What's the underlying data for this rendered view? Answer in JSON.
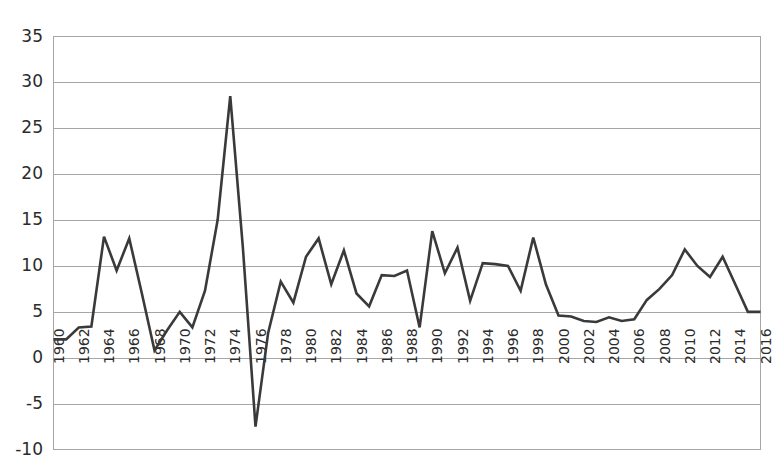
{
  "chart_data": {
    "type": "line",
    "title": "",
    "subtitle": "",
    "xlabel": "",
    "ylabel": "",
    "grid": true,
    "legend": false,
    "legend_position": "none",
    "line_color": "#3a3a3a",
    "grid_color": "#a6a6a6",
    "axis_text_color": "#2b2b2b",
    "background_color": "#ffffff",
    "xlim": [
      1960,
      2016
    ],
    "ylim": [
      -10,
      35
    ],
    "ytick_step": 5,
    "xtick_step": 2,
    "xtick_rotation": -90,
    "ytick_labels": [
      "35",
      "30",
      "25",
      "20",
      "15",
      "10",
      "5",
      "0",
      "-5",
      "-10"
    ],
    "ytick_values": [
      35,
      30,
      25,
      20,
      15,
      10,
      5,
      0,
      -5,
      -10
    ],
    "xtick_labels": [
      "1960",
      "1962",
      "1964",
      "1966",
      "1968",
      "1970",
      "1972",
      "1974",
      "1976",
      "1978",
      "1980",
      "1982",
      "1984",
      "1986",
      "1988",
      "1990",
      "1992",
      "1994",
      "1996",
      "1998",
      "2000",
      "2002",
      "2004",
      "2006",
      "2008",
      "2010",
      "2012",
      "2014",
      "2016"
    ],
    "x": [
      1960,
      1961,
      1962,
      1963,
      1964,
      1965,
      1966,
      1967,
      1968,
      1969,
      1970,
      1971,
      1972,
      1973,
      1974,
      1975,
      1976,
      1977,
      1978,
      1979,
      1980,
      1981,
      1982,
      1983,
      1984,
      1985,
      1986,
      1987,
      1988,
      1989,
      1990,
      1991,
      1992,
      1993,
      1994,
      1995,
      1996,
      1997,
      1998,
      1999,
      2000,
      2001,
      2002,
      2003,
      2004,
      2005,
      2006,
      2007,
      2008,
      2009,
      2010,
      2011,
      2012,
      2013,
      2014,
      2015,
      2016
    ],
    "values": [
      2.0,
      2.0,
      3.3,
      3.4,
      13.2,
      9.5,
      13.0,
      7.0,
      0.8,
      3.0,
      5.0,
      3.3,
      7.3,
      15.0,
      28.5,
      12.0,
      -7.5,
      2.7,
      8.3,
      6.0,
      11.0,
      13.0,
      8.0,
      11.7,
      7.0,
      5.6,
      9.0,
      8.9,
      9.5,
      3.3,
      13.8,
      9.2,
      12.0,
      6.2,
      10.3,
      10.2,
      10.0,
      7.3,
      13.1,
      8.0,
      4.6,
      4.5,
      4.0,
      3.9,
      4.4,
      4.0,
      4.2,
      6.3,
      7.5,
      9.0,
      11.8,
      10.0,
      8.8,
      11.0,
      8.0,
      5.0,
      5.0
    ],
    "series": [
      {
        "name": "series-1",
        "values": [
          2.0,
          2.0,
          3.3,
          3.4,
          13.2,
          9.5,
          13.0,
          7.0,
          0.8,
          3.0,
          5.0,
          3.3,
          7.3,
          15.0,
          28.5,
          12.0,
          -7.5,
          2.7,
          8.3,
          6.0,
          11.0,
          13.0,
          8.0,
          11.7,
          7.0,
          5.6,
          9.0,
          8.9,
          9.5,
          3.3,
          13.8,
          9.2,
          12.0,
          6.2,
          10.3,
          10.2,
          10.0,
          7.3,
          13.1,
          8.0,
          4.6,
          4.5,
          4.0,
          3.9,
          4.4,
          4.0,
          4.2,
          6.3,
          7.5,
          9.0,
          11.8,
          10.0,
          8.8,
          11.0,
          8.0,
          5.0,
          5.0
        ]
      }
    ],
    "annotations": []
  }
}
